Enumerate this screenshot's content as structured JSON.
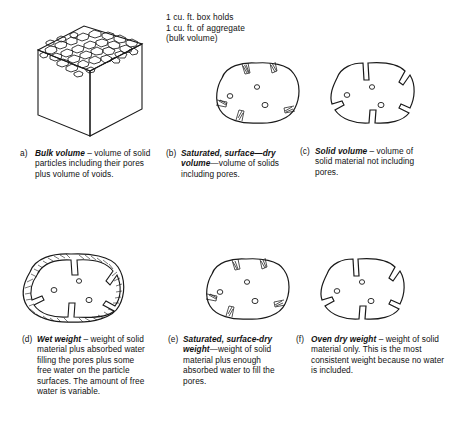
{
  "figure": {
    "cube_note": "1 cu. ft. box holds\n1 cu. ft. of aggregate\n(bulk volume)",
    "ink_color": "#1a1a1a",
    "background_color": "#ffffff"
  },
  "captions": {
    "a": {
      "label": "a)",
      "term": "Bulk volume",
      "text": " – volume of solid particles including their pores plus volume of voids."
    },
    "b": {
      "label": "(b)",
      "term": "Saturated, surface—dry volume",
      "text": "—volume of solids including pores."
    },
    "c": {
      "label": "(c)",
      "term": "Solid volume",
      "text": " – volume of solid material not including pores."
    },
    "d": {
      "label": "(d)",
      "term": "Wet weight",
      "text": " – weight of solid material plus absorbed water filling the pores plus some free water on the particle surfaces. The amount of free water is variable."
    },
    "e": {
      "label": "(e)",
      "term": "Saturated, surface-dry weight",
      "text": "—weight of solid material plus enough absorbed water to fill the pores."
    },
    "f": {
      "label": "(f)",
      "term": "Oven dry weight",
      "text": " – weight of solid material only. This is the most consistent weight because no water is included."
    }
  },
  "illustrations": {
    "cube": {
      "name": "aggregate-filled-cube",
      "description": "isometric 1 cu. ft. box with aggregate particles on top face"
    },
    "particle_b": {
      "name": "saturated-surface-dry-volume-particle",
      "description": "rounded aggregate particle with filled surface pores and interior pores"
    },
    "particle_c": {
      "name": "solid-volume-particle",
      "description": "aggregate particle outline with pores notched out of the boundary"
    },
    "particle_d": {
      "name": "wet-weight-particle",
      "description": "aggregate particle surrounded by a film of free water"
    },
    "particle_e": {
      "name": "saturated-surface-dry-weight-particle",
      "description": "aggregate particle with pores filled by absorbed water, dry surface"
    },
    "particle_f": {
      "name": "oven-dry-weight-particle",
      "description": "aggregate particle with empty pores, no water"
    }
  }
}
